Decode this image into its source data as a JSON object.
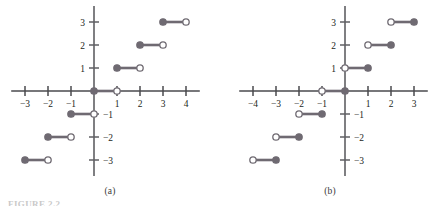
{
  "figure": {
    "caption_fragment": "FIGURE 2.2",
    "panels": [
      {
        "id": "a",
        "label": "(a)",
        "function_name": "floor",
        "origin_px": {
          "x": 94,
          "y": 91
        },
        "unit_px": 23,
        "x_axis": {
          "ticks": [
            -3,
            -2,
            -1,
            1,
            2,
            3,
            4
          ],
          "tick_labels": [
            "−3",
            "−2",
            "−1",
            "1",
            "2",
            "3",
            "4"
          ],
          "range": [
            -3.6,
            4.6
          ],
          "label_side": "below"
        },
        "y_axis": {
          "ticks": [
            3,
            2,
            1,
            -1,
            -2,
            -3
          ],
          "tick_labels": [
            "3",
            "2",
            "1",
            "−1",
            "−2",
            "−3"
          ],
          "range": [
            -3.7,
            3.7
          ],
          "positive_label_side": "left",
          "negative_label_side": "right"
        },
        "steps": [
          {
            "x_start": -3,
            "x_end": -2,
            "y": -3,
            "left_endpoint": "closed",
            "right_endpoint": "open"
          },
          {
            "x_start": -2,
            "x_end": -1,
            "y": -2,
            "left_endpoint": "closed",
            "right_endpoint": "open"
          },
          {
            "x_start": -1,
            "x_end": 0,
            "y": -1,
            "left_endpoint": "closed",
            "right_endpoint": "open"
          },
          {
            "x_start": 0,
            "x_end": 1,
            "y": 0,
            "left_endpoint": "closed",
            "right_endpoint": "open"
          },
          {
            "x_start": 1,
            "x_end": 2,
            "y": 1,
            "left_endpoint": "closed",
            "right_endpoint": "open"
          },
          {
            "x_start": 2,
            "x_end": 3,
            "y": 2,
            "left_endpoint": "closed",
            "right_endpoint": "open"
          },
          {
            "x_start": 3,
            "x_end": 4,
            "y": 3,
            "left_endpoint": "closed",
            "right_endpoint": "open"
          }
        ]
      },
      {
        "id": "b",
        "label": "(b)",
        "function_name": "ceiling",
        "origin_px": {
          "x": 125,
          "y": 91
        },
        "unit_px": 23,
        "x_axis": {
          "ticks": [
            -4,
            -3,
            -2,
            -1,
            1,
            2,
            3
          ],
          "tick_labels": [
            "−4",
            "−3",
            "−2",
            "−1",
            "1",
            "2",
            "3"
          ],
          "range": [
            -4.6,
            3.6
          ],
          "label_side": "below"
        },
        "y_axis": {
          "ticks": [
            3,
            2,
            1,
            -1,
            -2,
            -3
          ],
          "tick_labels": [
            "3",
            "2",
            "1",
            "−1",
            "−2",
            "−3"
          ],
          "range": [
            -3.7,
            3.7
          ],
          "positive_label_side": "left",
          "negative_label_side": "right"
        },
        "steps": [
          {
            "x_start": -4,
            "x_end": -3,
            "y": -3,
            "left_endpoint": "open",
            "right_endpoint": "closed"
          },
          {
            "x_start": -3,
            "x_end": -2,
            "y": -2,
            "left_endpoint": "open",
            "right_endpoint": "closed"
          },
          {
            "x_start": -2,
            "x_end": -1,
            "y": -1,
            "left_endpoint": "open",
            "right_endpoint": "closed"
          },
          {
            "x_start": -1,
            "x_end": 0,
            "y": 0,
            "left_endpoint": "open",
            "right_endpoint": "closed"
          },
          {
            "x_start": 0,
            "x_end": 1,
            "y": 1,
            "left_endpoint": "open",
            "right_endpoint": "closed"
          },
          {
            "x_start": 1,
            "x_end": 2,
            "y": 2,
            "left_endpoint": "open",
            "right_endpoint": "closed"
          },
          {
            "x_start": 2,
            "x_end": 3,
            "y": 3,
            "left_endpoint": "open",
            "right_endpoint": "closed"
          }
        ]
      }
    ]
  },
  "chart_data": {
    "type": "line",
    "title": "",
    "subtitle": "",
    "xlabel": "",
    "ylabel": "",
    "grid": false,
    "legend": "none",
    "charts": [
      {
        "panel": "(a)",
        "description": "Graph of the floor function y = floor(x); horizontal step segments with closed left endpoint and open right endpoint.",
        "xlim": [
          -3.6,
          4.6
        ],
        "ylim": [
          -3.7,
          3.7
        ],
        "xticks": [
          -3,
          -2,
          -1,
          1,
          2,
          3,
          4
        ],
        "yticks": [
          3,
          2,
          1,
          -1,
          -2,
          -3
        ],
        "segments": [
          {
            "x": [
              -3,
              -2
            ],
            "y": -3
          },
          {
            "x": [
              -2,
              -1
            ],
            "y": -2
          },
          {
            "x": [
              -1,
              0
            ],
            "y": -1
          },
          {
            "x": [
              0,
              1
            ],
            "y": 0
          },
          {
            "x": [
              1,
              2
            ],
            "y": 1
          },
          {
            "x": [
              2,
              3
            ],
            "y": 2
          },
          {
            "x": [
              3,
              4
            ],
            "y": 3
          }
        ]
      },
      {
        "panel": "(b)",
        "description": "Graph of the ceiling function y = ceil(x); horizontal step segments with open left endpoint and closed right endpoint.",
        "xlim": [
          -4.6,
          3.6
        ],
        "ylim": [
          -3.7,
          3.7
        ],
        "xticks": [
          -4,
          -3,
          -2,
          -1,
          1,
          2,
          3
        ],
        "yticks": [
          3,
          2,
          1,
          -1,
          -2,
          -3
        ],
        "segments": [
          {
            "x": [
              -4,
              -3
            ],
            "y": -3
          },
          {
            "x": [
              -3,
              -2
            ],
            "y": -2
          },
          {
            "x": [
              -2,
              -1
            ],
            "y": -1
          },
          {
            "x": [
              -1,
              0
            ],
            "y": 0
          },
          {
            "x": [
              0,
              1
            ],
            "y": 1
          },
          {
            "x": [
              1,
              2
            ],
            "y": 2
          },
          {
            "x": [
              2,
              3
            ],
            "y": 3
          }
        ]
      }
    ]
  },
  "style": {
    "segment_color": "#6f6a72",
    "axis_color": "#5f5f63",
    "x_axis_color": "#4a4a4e",
    "dot_fill_color": "#6f6a72",
    "dot_open_fill": "#ffffff",
    "label_color": "#231f20",
    "background": "#ffffff",
    "caption_color": "#c9c9c9"
  }
}
